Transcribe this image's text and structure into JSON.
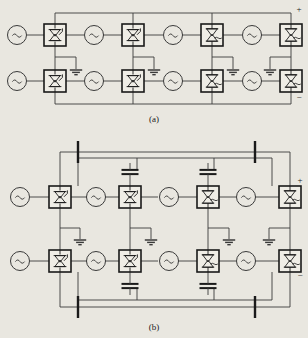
{
  "figure": {
    "kind": "circuit-schematic",
    "background_color": "#e9e7e0",
    "line_color": "#3a3a3a",
    "ink_color": "#1a1a1a",
    "width": 308,
    "height": 338
  },
  "captions": {
    "panel_a": "(a)",
    "panel_b": "(b)"
  },
  "polarity": {
    "positive": "+",
    "negative": "−"
  },
  "symbols": {
    "ac_source": "ac-source-icon",
    "ac_glyph": "~",
    "thyristor": "thyristor-icon",
    "light_triggered_thyristor": "light-triggered-thyristor-icon",
    "ground": "ground-icon",
    "capacitor": "capacitor-icon",
    "busbar": "busbar-icon"
  },
  "panel_a": {
    "label": "(a)",
    "rows": [
      {
        "name": "upper-row",
        "cells": [
          {
            "source": "~",
            "device": "thyristor-icon",
            "ground": true
          },
          {
            "source": "~",
            "device": "thyristor-icon",
            "ground": true
          },
          {
            "source": "~",
            "device": "light-triggered-thyristor-icon",
            "ground": true
          },
          {
            "source": "~",
            "device": "light-triggered-thyristor-icon",
            "ground": true
          }
        ]
      },
      {
        "name": "lower-row",
        "cells": [
          {
            "source": "~",
            "device": "thyristor-icon",
            "ground": true
          },
          {
            "source": "~",
            "device": "thyristor-icon",
            "ground": true
          },
          {
            "source": "~",
            "device": "light-triggered-thyristor-icon",
            "ground": true
          },
          {
            "source": "~",
            "device": "light-triggered-thyristor-icon",
            "ground": true
          }
        ]
      }
    ],
    "terminals": {
      "top_right": "+",
      "bottom_right": "−"
    },
    "capacitor_count": 0,
    "busbar_count": 0
  },
  "panel_b": {
    "label": "(b)",
    "rows": [
      {
        "name": "upper-row",
        "cells": [
          {
            "source": "~",
            "device": "thyristor-icon",
            "ground": true,
            "capacitor": false
          },
          {
            "source": "~",
            "device": "thyristor-icon",
            "ground": true,
            "capacitor": true
          },
          {
            "source": "~",
            "device": "light-triggered-thyristor-icon",
            "ground": true,
            "capacitor": true
          },
          {
            "source": "~",
            "device": "light-triggered-thyristor-icon",
            "ground": true,
            "capacitor": false
          }
        ]
      },
      {
        "name": "lower-row",
        "cells": [
          {
            "source": "~",
            "device": "thyristor-icon",
            "ground": true,
            "capacitor": false
          },
          {
            "source": "~",
            "device": "thyristor-icon",
            "ground": true,
            "capacitor": true
          },
          {
            "source": "~",
            "device": "light-triggered-thyristor-icon",
            "ground": true,
            "capacitor": true
          },
          {
            "source": "~",
            "device": "light-triggered-thyristor-icon",
            "ground": true,
            "capacitor": false
          }
        ]
      }
    ],
    "terminals": {
      "top_right": "+",
      "bottom_right": "−"
    },
    "capacitor_count": 4,
    "busbar_count": 4
  }
}
